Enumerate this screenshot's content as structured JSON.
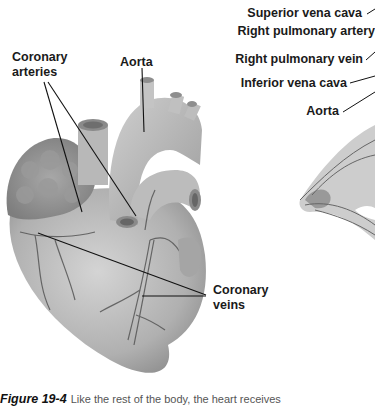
{
  "figure": {
    "left_panel": {
      "labels": {
        "coronary_arteries": "Coronary\narteries",
        "coronary_arteries_line1": "Coronary",
        "coronary_arteries_line2": "arteries",
        "aorta": "Aorta",
        "coronary_veins_line1": "Coronary",
        "coronary_veins_line2": "veins"
      }
    },
    "right_panel": {
      "labels": {
        "superior_vena_cava": "Superior vena cava",
        "right_pulmonary_artery": "Right pulmonary artery",
        "right_pulmonary_vein": "Right pulmonary vein",
        "inferior_vena_cava": "Inferior vena cava",
        "aorta": "Aorta"
      }
    },
    "caption": {
      "number": "Figure 19-4",
      "text": "Like the rest of the body, the heart receives"
    },
    "colors": {
      "tissue": "#b5b5b5",
      "tissue_dark": "#8a8a8a",
      "vessel": "#5a5a5a",
      "leader_line": "#111111"
    }
  }
}
